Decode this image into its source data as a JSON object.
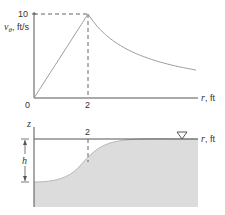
{
  "top_plot": {
    "y_label_var": "v",
    "y_label_sub": "θ",
    "y_label_unit": ", ft/s",
    "y_tick": "10",
    "x_tick_origin": "0",
    "x_tick_mid": "2",
    "x_label_var": "r",
    "x_label_unit": ", ft",
    "profile": {
      "peak_r": 2,
      "peak_v": 10,
      "r_max": 6,
      "description": "linear rise to peak at r=2, then decays as 1/r"
    }
  },
  "bottom_plot": {
    "z_label": "z",
    "h_label": "h",
    "tick_mid": "2",
    "x_label_var": "r",
    "x_label_unit": ", ft",
    "free_surface_symbol": "▽"
  },
  "colors": {
    "axis": "#555555",
    "curve": "#999999",
    "fill": "#dcdcdc",
    "text": "#333333"
  }
}
